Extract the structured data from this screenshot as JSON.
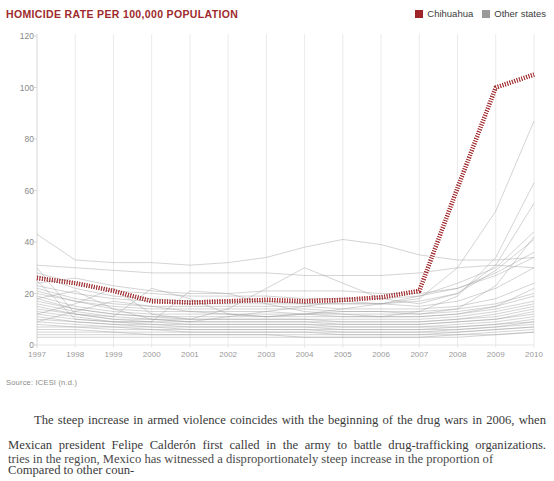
{
  "top_clipped_text": "",
  "figure": {
    "title": "HOMICIDE RATE PER 100,000 POPULATION",
    "title_color": "#9e2a2b",
    "source": "Source: ICESI (n.d.)",
    "legend": [
      {
        "label": "Chihuahua",
        "color": "#a02528",
        "icon": "square-swatch"
      },
      {
        "label": "Other states",
        "color": "#9a9a9a",
        "icon": "square-swatch"
      }
    ]
  },
  "chart_data": {
    "type": "line",
    "title": "HOMICIDE RATE PER 100,000 POPULATION",
    "xlabel": "",
    "ylabel": "",
    "ylim": [
      0,
      120
    ],
    "yticks": [
      0,
      20,
      40,
      60,
      80,
      100,
      120
    ],
    "grid": true,
    "legend_position": "top-right",
    "x": [
      1997,
      1998,
      1999,
      2000,
      2001,
      2002,
      2003,
      2004,
      2005,
      2006,
      2007,
      2008,
      2009,
      2010
    ],
    "categories": [
      "1997",
      "1998",
      "1999",
      "2000",
      "2001",
      "2002",
      "2003",
      "2004",
      "2005",
      "2006",
      "2007",
      "2008",
      "2009",
      "2010"
    ],
    "highlight_series": {
      "name": "Chihuahua",
      "color": "#a02528",
      "style": "dotted-thick",
      "values": [
        26,
        24,
        21,
        17,
        16.5,
        17,
        17.5,
        17,
        17.5,
        18.5,
        21,
        61,
        100,
        105
      ]
    },
    "series": [
      {
        "name": "Chihuahua",
        "color": "#a02528",
        "values": [
          26,
          24,
          21,
          17,
          16.5,
          17,
          17.5,
          17,
          17.5,
          18.5,
          21,
          61,
          100,
          105
        ]
      },
      {
        "name": "Other state 1",
        "color": "#9a9a9a",
        "values": [
          43,
          33,
          32,
          32,
          31,
          32,
          34,
          38,
          41,
          39,
          35,
          33,
          33,
          34
        ]
      },
      {
        "name": "Other state 2",
        "color": "#9a9a9a",
        "values": [
          31,
          30,
          29,
          28,
          28,
          28,
          28,
          27,
          27,
          27,
          28,
          30,
          31,
          30
        ]
      },
      {
        "name": "Other state 3",
        "color": "#9a9a9a",
        "values": [
          28,
          24,
          21,
          20,
          19,
          19,
          19,
          18,
          18,
          18,
          19,
          22,
          28,
          36
        ]
      },
      {
        "name": "Other state 4",
        "color": "#9a9a9a",
        "values": [
          27,
          22,
          19,
          18,
          17,
          17,
          17,
          16,
          16,
          16,
          17,
          20,
          31,
          55
        ]
      },
      {
        "name": "Other state 5",
        "color": "#9a9a9a",
        "values": [
          24,
          26,
          23,
          21,
          20,
          20,
          21,
          21,
          21,
          20,
          20,
          22,
          27,
          34
        ]
      },
      {
        "name": "Other state 6",
        "color": "#9a9a9a",
        "values": [
          23,
          20,
          18,
          17,
          16,
          16,
          16,
          16,
          16,
          16,
          15,
          17,
          22,
          30
        ]
      },
      {
        "name": "Other state 7",
        "color": "#9a9a9a",
        "values": [
          22,
          18,
          16,
          15,
          15,
          15,
          15,
          15,
          14,
          14,
          14,
          15,
          18,
          24
        ]
      },
      {
        "name": "Other state 8",
        "color": "#9a9a9a",
        "values": [
          21,
          17,
          15,
          14,
          14,
          14,
          14,
          14,
          13,
          13,
          13,
          14,
          16,
          20
        ]
      },
      {
        "name": "Other state 9",
        "color": "#9a9a9a",
        "values": [
          20,
          17,
          14,
          13,
          13,
          13,
          13,
          12,
          12,
          12,
          12,
          13,
          15,
          19
        ]
      },
      {
        "name": "Other state 10",
        "color": "#9a9a9a",
        "values": [
          19,
          15,
          13,
          12,
          12,
          12,
          12,
          12,
          11,
          11,
          11,
          12,
          14,
          17
        ]
      },
      {
        "name": "Other state 11",
        "color": "#9a9a9a",
        "values": [
          18,
          14,
          12,
          11,
          11,
          11,
          11,
          11,
          11,
          11,
          11,
          12,
          15,
          22
        ]
      },
      {
        "name": "Other state 12",
        "color": "#9a9a9a",
        "values": [
          17,
          14,
          12,
          11,
          10,
          10,
          10,
          10,
          10,
          10,
          10,
          11,
          13,
          16
        ]
      },
      {
        "name": "Other state 13",
        "color": "#9a9a9a",
        "values": [
          16,
          13,
          11,
          10,
          10,
          10,
          10,
          10,
          9,
          9,
          9,
          10,
          12,
          15
        ]
      },
      {
        "name": "Other state 14",
        "color": "#9a9a9a",
        "values": [
          15,
          12,
          10,
          10,
          9,
          9,
          9,
          9,
          9,
          9,
          9,
          10,
          11,
          14
        ]
      },
      {
        "name": "Other state 15",
        "color": "#9a9a9a",
        "values": [
          14,
          12,
          10,
          9,
          9,
          9,
          9,
          9,
          8,
          8,
          8,
          9,
          10,
          13
        ]
      },
      {
        "name": "Other state 16",
        "color": "#9a9a9a",
        "values": [
          13,
          11,
          9,
          9,
          8,
          8,
          8,
          8,
          8,
          8,
          8,
          9,
          10,
          12
        ]
      },
      {
        "name": "Other state 17",
        "color": "#9a9a9a",
        "values": [
          12,
          10,
          9,
          8,
          8,
          8,
          8,
          8,
          7,
          7,
          7,
          8,
          9,
          11
        ]
      },
      {
        "name": "Other state 18",
        "color": "#9a9a9a",
        "values": [
          11,
          9,
          8,
          8,
          7,
          7,
          7,
          7,
          7,
          7,
          7,
          7,
          8,
          10
        ]
      },
      {
        "name": "Other state 19",
        "color": "#9a9a9a",
        "values": [
          10,
          9,
          8,
          7,
          7,
          7,
          7,
          7,
          6,
          6,
          6,
          7,
          8,
          9
        ]
      },
      {
        "name": "Other state 20",
        "color": "#9a9a9a",
        "values": [
          9,
          8,
          7,
          7,
          6,
          6,
          6,
          6,
          6,
          6,
          6,
          6,
          7,
          9
        ]
      },
      {
        "name": "Other state 21",
        "color": "#9a9a9a",
        "values": [
          8,
          7,
          7,
          6,
          6,
          6,
          6,
          6,
          5,
          5,
          5,
          6,
          7,
          8
        ]
      },
      {
        "name": "Other state 22",
        "color": "#9a9a9a",
        "values": [
          7,
          7,
          6,
          6,
          5,
          5,
          5,
          5,
          5,
          5,
          5,
          5,
          6,
          7
        ]
      },
      {
        "name": "Other state 23",
        "color": "#9a9a9a",
        "values": [
          6,
          6,
          5,
          5,
          5,
          5,
          5,
          5,
          4,
          4,
          4,
          5,
          6,
          7
        ]
      },
      {
        "name": "Other state 24",
        "color": "#9a9a9a",
        "values": [
          5,
          5,
          5,
          4,
          4,
          4,
          4,
          4,
          4,
          4,
          4,
          4,
          5,
          6
        ]
      },
      {
        "name": "Other state 25",
        "color": "#9a9a9a",
        "values": [
          4,
          4,
          4,
          4,
          4,
          4,
          4,
          3,
          3,
          3,
          3,
          4,
          4,
          5
        ]
      },
      {
        "name": "Other state 26",
        "color": "#9a9a9a",
        "values": [
          3,
          3,
          3,
          3,
          3,
          3,
          3,
          3,
          3,
          3,
          3,
          3,
          4,
          5
        ]
      },
      {
        "name": "Other state 27",
        "color": "#9a9a9a",
        "values": [
          12,
          16,
          22,
          12,
          10,
          14,
          22,
          30,
          24,
          18,
          16,
          20,
          29,
          41
        ]
      },
      {
        "name": "Other state 28",
        "color": "#9a9a9a",
        "values": [
          30,
          12,
          11,
          22,
          18,
          12,
          11,
          12,
          13,
          13,
          12,
          14,
          23,
          42
        ]
      },
      {
        "name": "Other state 29",
        "color": "#9a9a9a",
        "values": [
          25,
          10,
          9,
          9,
          21,
          20,
          16,
          13,
          12,
          11,
          13,
          19,
          34,
          63
        ]
      },
      {
        "name": "Other state 30",
        "color": "#9a9a9a",
        "values": [
          18,
          21,
          14,
          10,
          9,
          11,
          13,
          15,
          17,
          16,
          18,
          30,
          52,
          87
        ]
      },
      {
        "name": "Other state 31",
        "color": "#9a9a9a",
        "values": [
          9,
          13,
          17,
          15,
          13,
          12,
          11,
          12,
          14,
          16,
          19,
          24,
          30,
          44
        ]
      }
    ]
  },
  "body": {
    "paragraph": "The steep increase in armed violence coincides with the beginning of the drug wars in 2006, when Mexican president Felipe Calderón first called in the army to battle drug-trafficking organizations. Compared to other coun-",
    "clipped_line": "tries in the region, Mexico has witnessed a disproportionately steep increase in the proportion of homicides by"
  }
}
